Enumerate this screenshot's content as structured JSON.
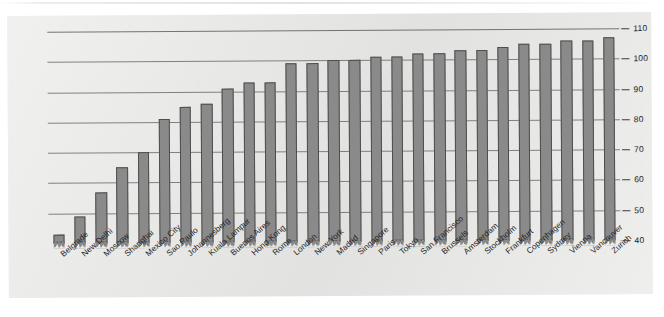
{
  "chart_data": {
    "type": "bar",
    "title": "",
    "subtitle": "",
    "xlabel": "",
    "ylabel": "",
    "ylim": [
      40,
      110
    ],
    "yticks": [
      40,
      50,
      60,
      70,
      80,
      90,
      100,
      110
    ],
    "ytick_labels": [
      "40",
      "50",
      "60",
      "70",
      "80",
      "90",
      "100",
      "110"
    ],
    "grid": true,
    "legend": null,
    "axis_break": true,
    "bar_color": "#8a8a8a",
    "bar_edge_color": "#4e4e4e",
    "plot_background": "#e9e9e7",
    "categories": [
      "Belgrade",
      "New Delhi",
      "Moscow",
      "Shanghai",
      "Mexico City",
      "Sao Paulo",
      "Johannesberg",
      "Kuala Lampur",
      "Buenos Aires",
      "Hong Kong",
      "Rome",
      "London",
      "New York",
      "Madrid",
      "Singapore",
      "Paris",
      "Tokyo",
      "San Francisco",
      "Brussels",
      "Amsterdam",
      "Stockholm",
      "Frankfurt",
      "Copenhagen",
      "Sydney",
      "Vienna",
      "Vancouver",
      "Zurich"
    ],
    "values": [
      43,
      49,
      57,
      65,
      70,
      81,
      85,
      86,
      91,
      93,
      93,
      99,
      99,
      100,
      100,
      101,
      101,
      102,
      102,
      103,
      103,
      104,
      105,
      105,
      106,
      106,
      107
    ]
  }
}
